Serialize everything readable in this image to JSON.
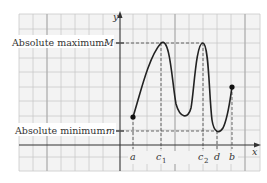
{
  "figure": {
    "type": "function graph with extrema",
    "axes": {
      "x_label": "x",
      "y_label": "y"
    },
    "labels": {
      "abs_max": "Absolute maximum:",
      "abs_max_var": "M",
      "abs_min": "Absolute minimum:",
      "abs_min_var": "m"
    },
    "x_ticks": [
      {
        "name": "a",
        "sub": ""
      },
      {
        "name": "c",
        "sub": "1"
      },
      {
        "name": "c",
        "sub": "2"
      },
      {
        "name": "d",
        "sub": ""
      },
      {
        "name": "b",
        "sub": ""
      }
    ],
    "points": {
      "start": "(a, f(a)) closed endpoint",
      "end": "(b, f(b)) closed endpoint",
      "max1": "(c1, M)",
      "max2": "(c2, M)",
      "min": "(d, m)"
    },
    "colors": {
      "grid": "#c8c8c8",
      "grid_bg": "#f4f4f4",
      "curve": "#222222",
      "axis": "#333333"
    }
  }
}
